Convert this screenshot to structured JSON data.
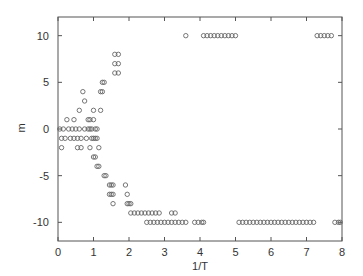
{
  "chart_data": {
    "type": "scatter",
    "title": "",
    "xlabel": "1/T",
    "ylabel": "m",
    "xlim": [
      0,
      8
    ],
    "ylim": [
      -12,
      12
    ],
    "xticks": [
      0,
      1,
      2,
      3,
      4,
      5,
      6,
      7,
      8
    ],
    "yticks": [
      -10,
      -5,
      0,
      5,
      10
    ],
    "grid": false,
    "legend": null,
    "marker": "open-circle",
    "series": [
      {
        "name": "m vs 1/T",
        "points": [
          [
            0.05,
            0
          ],
          [
            0.1,
            -1
          ],
          [
            0.15,
            0
          ],
          [
            0.2,
            -1
          ],
          [
            0.1,
            -2
          ],
          [
            0.25,
            1
          ],
          [
            0.3,
            0
          ],
          [
            0.35,
            -1
          ],
          [
            0.4,
            0
          ],
          [
            0.45,
            1
          ],
          [
            0.45,
            -1
          ],
          [
            0.5,
            0
          ],
          [
            0.55,
            -1
          ],
          [
            0.55,
            -2
          ],
          [
            0.6,
            2
          ],
          [
            0.6,
            0
          ],
          [
            0.65,
            -1
          ],
          [
            0.65,
            -2
          ],
          [
            0.7,
            4
          ],
          [
            0.75,
            3
          ],
          [
            0.75,
            0
          ],
          [
            0.8,
            -1
          ],
          [
            0.85,
            1
          ],
          [
            0.9,
            1
          ],
          [
            0.85,
            0
          ],
          [
            0.9,
            0
          ],
          [
            0.95,
            -1
          ],
          [
            0.95,
            0
          ],
          [
            0.9,
            -2
          ],
          [
            1.0,
            2
          ],
          [
            1.0,
            1
          ],
          [
            1.05,
            0
          ],
          [
            1.05,
            -1
          ],
          [
            1.0,
            -1
          ],
          [
            1.1,
            0
          ],
          [
            1.1,
            -1
          ],
          [
            1.15,
            -2
          ],
          [
            1.2,
            2
          ],
          [
            1.2,
            4
          ],
          [
            1.25,
            5
          ],
          [
            1.3,
            5
          ],
          [
            1.25,
            4
          ],
          [
            1.0,
            -3
          ],
          [
            1.05,
            -3
          ],
          [
            1.1,
            -4
          ],
          [
            1.15,
            -4
          ],
          [
            1.3,
            -5
          ],
          [
            1.35,
            -5
          ],
          [
            1.45,
            -6
          ],
          [
            1.5,
            -6
          ],
          [
            1.55,
            -6
          ],
          [
            1.45,
            -7
          ],
          [
            1.5,
            -7
          ],
          [
            1.55,
            -7
          ],
          [
            1.55,
            -8
          ],
          [
            1.6,
            6
          ],
          [
            1.7,
            6
          ],
          [
            1.6,
            7
          ],
          [
            1.7,
            7
          ],
          [
            1.6,
            8
          ],
          [
            1.7,
            8
          ],
          [
            1.9,
            -6
          ],
          [
            1.95,
            -7
          ],
          [
            2.0,
            -8
          ],
          [
            2.05,
            -8
          ],
          [
            1.95,
            -8
          ],
          [
            2.05,
            -9
          ],
          [
            2.15,
            -9
          ],
          [
            2.25,
            -9
          ],
          [
            2.35,
            -9
          ],
          [
            2.45,
            -9
          ],
          [
            2.55,
            -9
          ],
          [
            2.65,
            -9
          ],
          [
            2.75,
            -9
          ],
          [
            2.85,
            -9
          ],
          [
            3.2,
            -9
          ],
          [
            3.3,
            -9
          ],
          [
            2.5,
            -10
          ],
          [
            2.6,
            -10
          ],
          [
            2.7,
            -10
          ],
          [
            2.8,
            -10
          ],
          [
            2.9,
            -10
          ],
          [
            3.0,
            -10
          ],
          [
            3.1,
            -10
          ],
          [
            3.2,
            -10
          ],
          [
            3.3,
            -10
          ],
          [
            3.4,
            -10
          ],
          [
            3.5,
            -10
          ],
          [
            3.6,
            -10
          ],
          [
            3.85,
            -10
          ],
          [
            3.95,
            -10
          ],
          [
            4.05,
            -10
          ],
          [
            4.1,
            -10
          ],
          [
            3.6,
            10
          ],
          [
            4.1,
            10
          ],
          [
            4.2,
            10
          ],
          [
            4.3,
            10
          ],
          [
            4.4,
            10
          ],
          [
            4.5,
            10
          ],
          [
            4.6,
            10
          ],
          [
            4.7,
            10
          ],
          [
            4.8,
            10
          ],
          [
            4.9,
            10
          ],
          [
            5.0,
            10
          ],
          [
            5.1,
            -10
          ],
          [
            5.2,
            -10
          ],
          [
            5.3,
            -10
          ],
          [
            5.4,
            -10
          ],
          [
            5.5,
            -10
          ],
          [
            5.6,
            -10
          ],
          [
            5.7,
            -10
          ],
          [
            5.8,
            -10
          ],
          [
            5.9,
            -10
          ],
          [
            6.0,
            -10
          ],
          [
            6.1,
            -10
          ],
          [
            6.2,
            -10
          ],
          [
            6.3,
            -10
          ],
          [
            6.4,
            -10
          ],
          [
            6.5,
            -10
          ],
          [
            6.6,
            -10
          ],
          [
            6.7,
            -10
          ],
          [
            6.8,
            -10
          ],
          [
            6.9,
            -10
          ],
          [
            7.0,
            -10
          ],
          [
            7.1,
            -10
          ],
          [
            7.2,
            -10
          ],
          [
            7.3,
            10
          ],
          [
            7.4,
            10
          ],
          [
            7.5,
            10
          ],
          [
            7.6,
            10
          ],
          [
            7.7,
            10
          ],
          [
            7.8,
            -10
          ],
          [
            7.9,
            -10
          ],
          [
            7.95,
            -10
          ]
        ]
      }
    ]
  }
}
